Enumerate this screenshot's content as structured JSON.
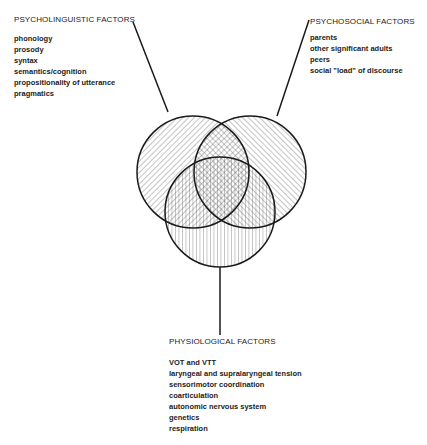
{
  "diagram": {
    "type": "venn",
    "sets": [
      {
        "id": "psycholinguistic",
        "heading": "PSYCHOLINGUISTIC FACTORS",
        "items": [
          "phonology",
          "prosody",
          "syntax",
          "semantics/cognition",
          "propositionality of utterance",
          "pragmatics"
        ],
        "hatch": "diagonal-backslash"
      },
      {
        "id": "psychosocial",
        "heading": "PSYCHOSOCIAL FACTORS",
        "items": [
          "parents",
          "other significant adults",
          "peers",
          "social \"load\" of discourse"
        ],
        "hatch": "diagonal-slash"
      },
      {
        "id": "physiological",
        "heading": "PHYSIOLOGICAL FACTORS",
        "items": [
          "VOT and VTT",
          "laryngeal and supralaryngeal tension",
          "sensorimotor coordination",
          "coarticulation",
          "autonomic nervous system",
          "genetics",
          "respiration"
        ],
        "hatch": "vertical"
      }
    ],
    "colors": {
      "line": "#1a1a1a",
      "hatch": "#555555",
      "background": "#ffffff"
    }
  }
}
